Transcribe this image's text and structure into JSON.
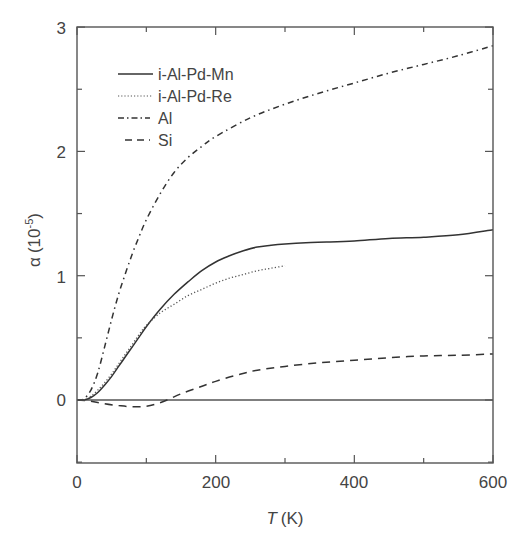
{
  "chart_data": {
    "type": "line",
    "title": "",
    "xlabel": "T (K)",
    "xlabel_italic_part": "T",
    "xlabel_unit": "(K)",
    "ylabel": "α (10⁻⁵)",
    "ylabel_symbol": "α",
    "ylabel_unit": "(10",
    "ylabel_exp": "-5",
    "xlim": [
      0,
      600
    ],
    "ylim": [
      -0.5,
      3
    ],
    "xticks": [
      0,
      200,
      400,
      600
    ],
    "xticks_minor": [
      100,
      300,
      500
    ],
    "yticks": [
      0,
      1,
      2,
      3
    ],
    "yticks_minor": [
      -0.5,
      0.5,
      1.5,
      2.5
    ],
    "grid": false,
    "zero_line": true,
    "legend_position": "upper left",
    "series": [
      {
        "name": "i-Al-Pd-Mn",
        "style": "solid",
        "x": [
          0,
          10,
          20,
          30,
          40,
          50,
          60,
          70,
          80,
          90,
          100,
          120,
          140,
          160,
          180,
          200,
          220,
          240,
          260,
          280,
          300,
          330,
          360,
          400,
          450,
          500,
          550,
          600
        ],
        "y": [
          0,
          0.0,
          0.02,
          0.06,
          0.12,
          0.19,
          0.27,
          0.35,
          0.43,
          0.51,
          0.59,
          0.73,
          0.85,
          0.95,
          1.04,
          1.11,
          1.16,
          1.2,
          1.23,
          1.245,
          1.255,
          1.265,
          1.27,
          1.28,
          1.3,
          1.31,
          1.33,
          1.37
        ]
      },
      {
        "name": "i-Al-Pd-Re",
        "style": "dotted",
        "x": [
          0,
          10,
          20,
          30,
          40,
          50,
          60,
          70,
          80,
          90,
          100,
          120,
          140,
          160,
          180,
          200,
          220,
          240,
          260,
          280,
          300
        ],
        "y": [
          0,
          0.0,
          0.03,
          0.08,
          0.14,
          0.21,
          0.29,
          0.37,
          0.45,
          0.53,
          0.6,
          0.7,
          0.77,
          0.84,
          0.89,
          0.94,
          0.98,
          1.01,
          1.04,
          1.06,
          1.08
        ]
      },
      {
        "name": "Al",
        "style": "dashdot",
        "x": [
          0,
          10,
          20,
          30,
          40,
          50,
          60,
          70,
          80,
          90,
          100,
          120,
          140,
          160,
          180,
          200,
          250,
          300,
          350,
          400,
          450,
          500,
          550,
          600
        ],
        "y": [
          0,
          0.01,
          0.08,
          0.22,
          0.43,
          0.65,
          0.85,
          1.02,
          1.18,
          1.32,
          1.45,
          1.66,
          1.83,
          1.95,
          2.04,
          2.12,
          2.27,
          2.38,
          2.47,
          2.55,
          2.63,
          2.7,
          2.77,
          2.85
        ]
      },
      {
        "name": "Si",
        "style": "dashed",
        "x": [
          0,
          20,
          40,
          60,
          80,
          100,
          115,
          130,
          150,
          175,
          200,
          230,
          260,
          300,
          350,
          400,
          450,
          500,
          550,
          600
        ],
        "y": [
          0,
          -0.01,
          -0.03,
          -0.045,
          -0.055,
          -0.05,
          -0.03,
          0.0,
          0.05,
          0.1,
          0.15,
          0.2,
          0.24,
          0.27,
          0.3,
          0.32,
          0.34,
          0.355,
          0.36,
          0.37
        ]
      }
    ]
  },
  "plot": {
    "x_tick_labels": [
      "0",
      "200",
      "400",
      "600"
    ],
    "y_tick_labels": [
      "0",
      "1",
      "2",
      "3"
    ],
    "legend": [
      {
        "label": "i-Al-Pd-Mn"
      },
      {
        "label": "i-Al-Pd-Re"
      },
      {
        "label": "Al"
      },
      {
        "label": "Si"
      }
    ],
    "colors": {
      "line": "#333333",
      "axis": "#555555",
      "text": "#444444"
    }
  }
}
